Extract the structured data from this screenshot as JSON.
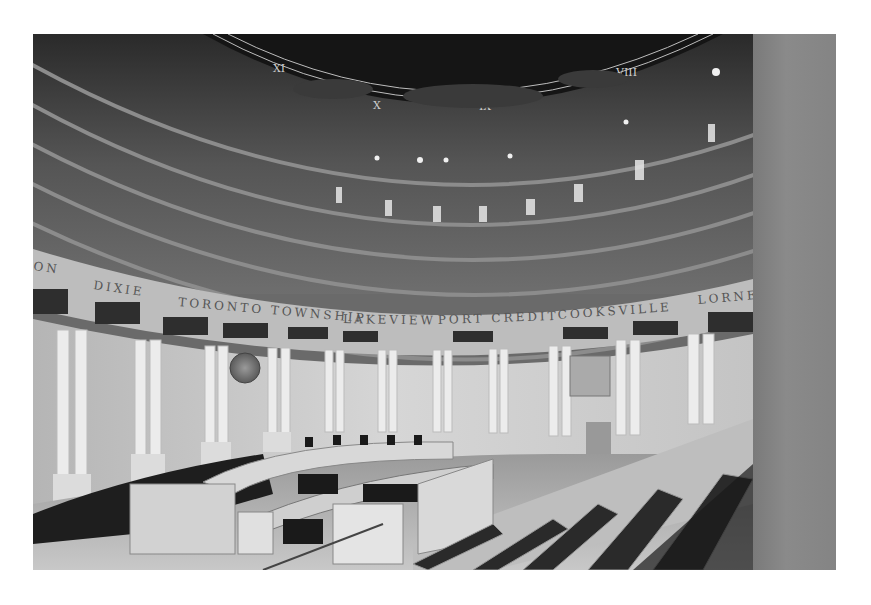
{
  "image": {
    "description": "Black-and-white photograph of a circular council chamber with a painted domed ceiling, a curved frieze inscription, columns, a horseshoe council desk and public gallery seating in the foreground",
    "palette": {
      "background": "#ffffff",
      "dome": "#1a1a1a",
      "dome_lines": "#bdbdbd",
      "ceiling_bands": "#5a5a5a",
      "frieze": "#b8b8b8",
      "walls": "#cfcfcf",
      "columns": "#e8e8e8",
      "seating": "#2a2a2a",
      "pillar": "#828282"
    }
  },
  "dome": {
    "numerals": [
      "XI",
      "X",
      "IX",
      "VIII"
    ]
  },
  "frieze": {
    "inscription": [
      "ON",
      "DIXIE",
      "TORONTO TOWNSHIP",
      "LAKEVIEW",
      "PORT CREDIT",
      "COOKSVILLE",
      "LORNE"
    ],
    "separator": "·"
  },
  "wall": {
    "seal": "crest-medallion"
  }
}
